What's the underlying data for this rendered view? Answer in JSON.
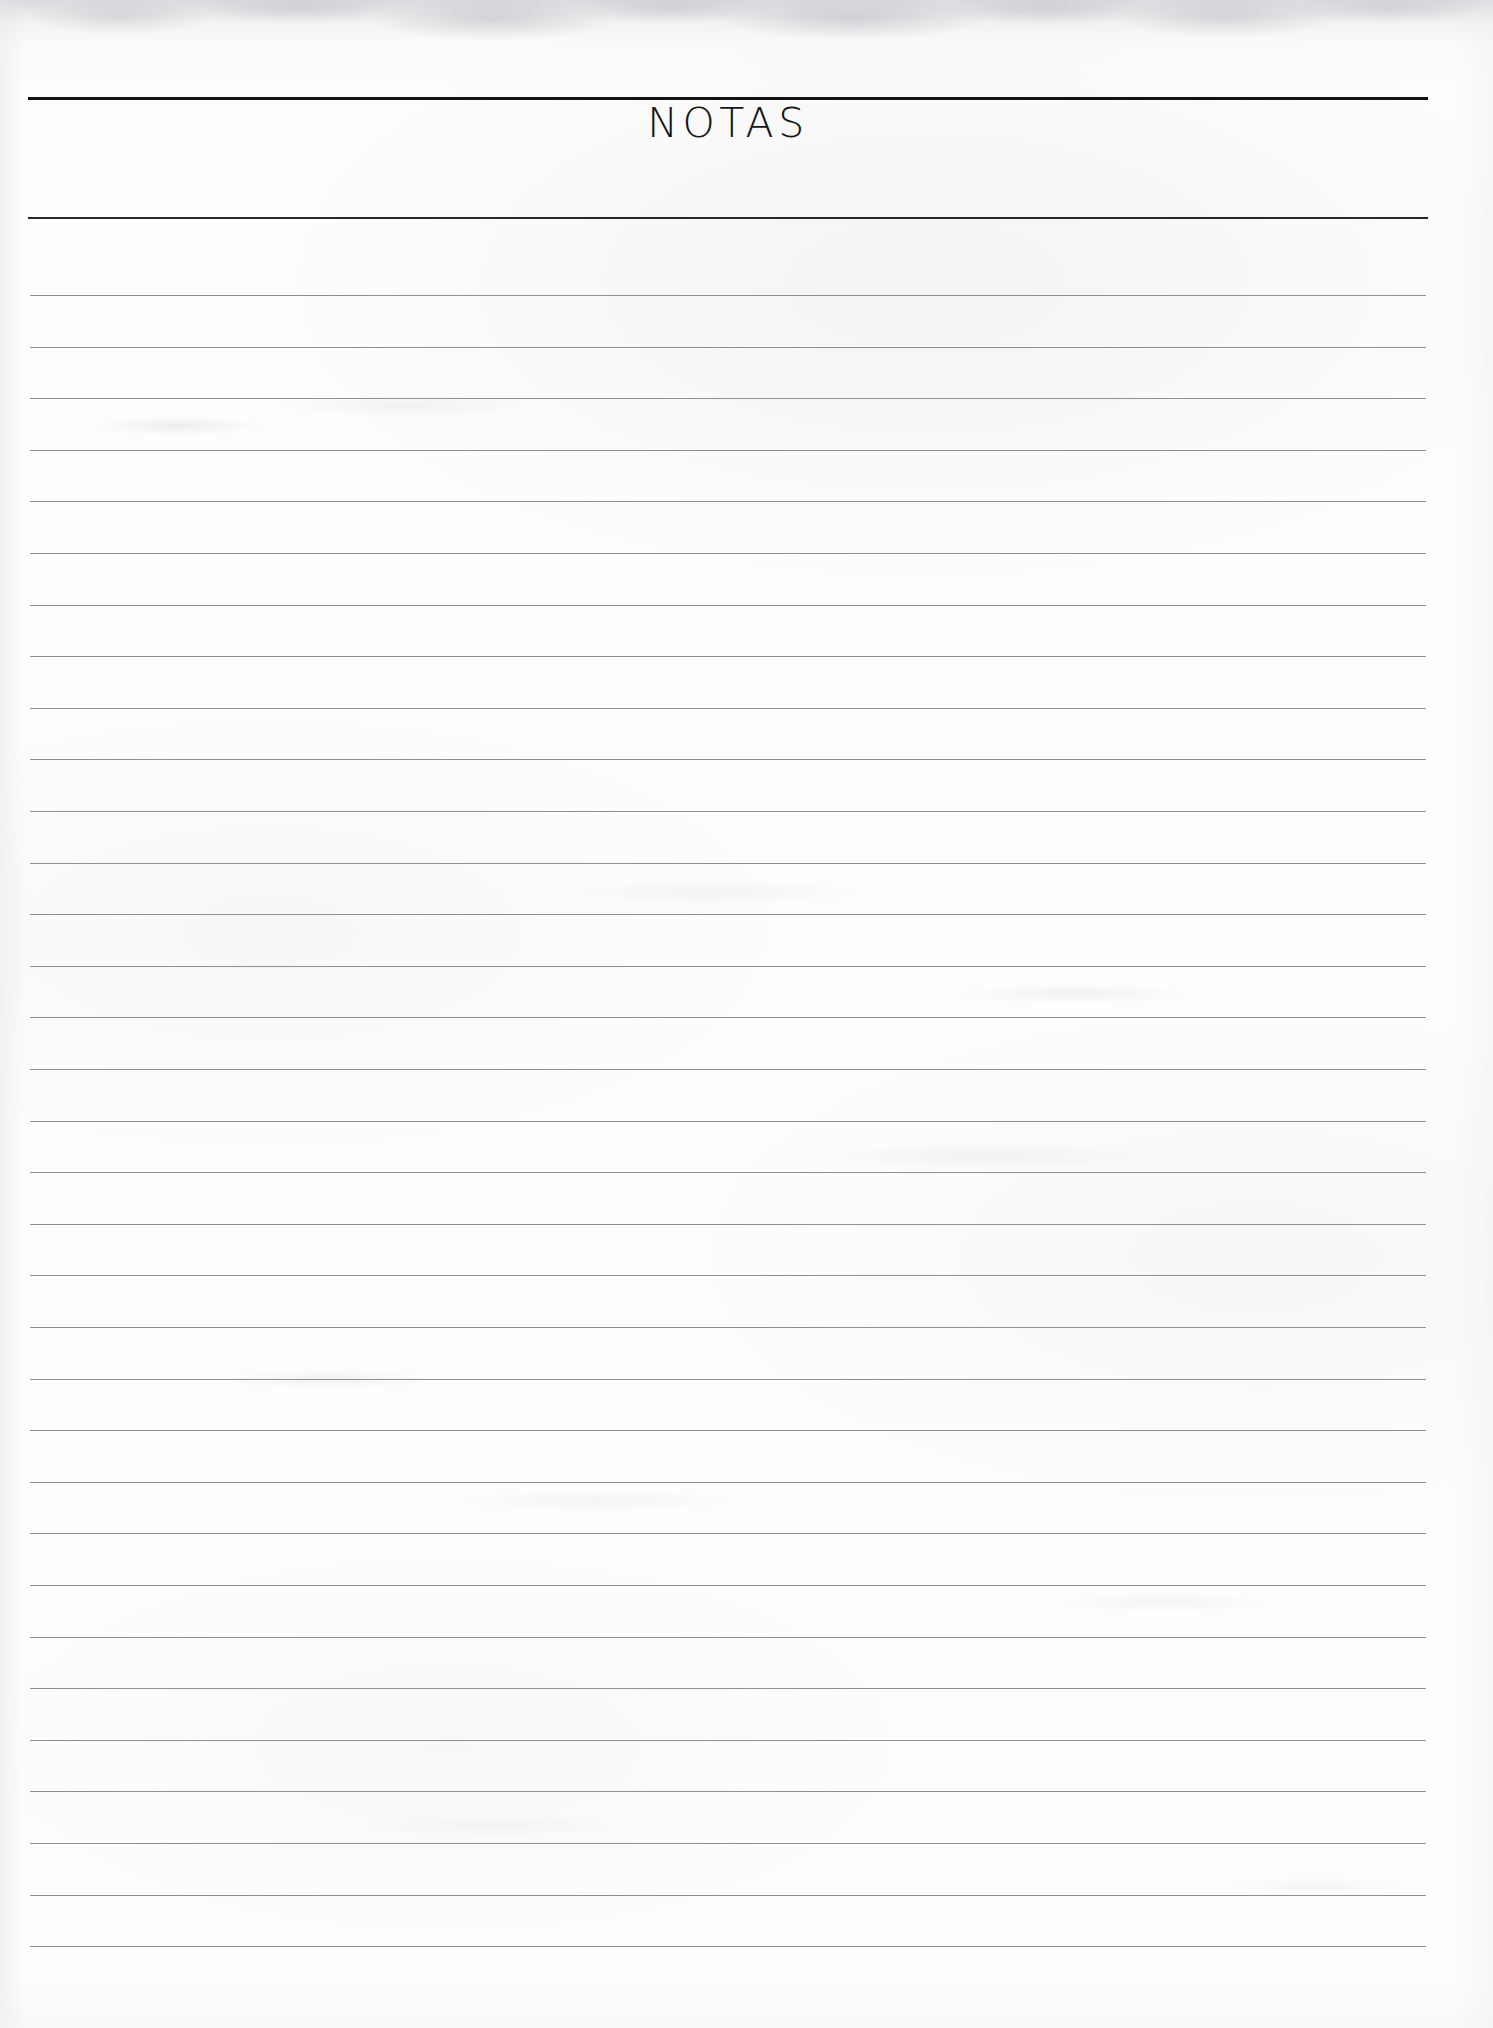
{
  "page": {
    "title": "NOTAS",
    "paper_color": "#fdfdfc",
    "header_rule_color": "#111214",
    "header_rule_secondary_color": "#26282b",
    "rule_line_color": "#8f9093",
    "title_color": "#141518"
  },
  "header": {
    "title": "NOTAS",
    "rule_top": {
      "name": "header-top-rule",
      "x": 28,
      "y": 97,
      "width": 1400,
      "thickness": 3
    },
    "rule_bottom": {
      "name": "header-bottom-rule",
      "x": 28,
      "y": 217,
      "width": 1400,
      "thickness": 2
    }
  },
  "notes_area": {
    "line_count": 33,
    "first_line_y": 295,
    "line_spacing": 51.6,
    "line_left": 30,
    "line_width": 1396,
    "line_thickness": 1,
    "lines_y": [
      295,
      346.6,
      398.2,
      449.8,
      501.4,
      553,
      604.6,
      656.2,
      707.8,
      759.4,
      811,
      862.6,
      914.2,
      965.8,
      1017.4,
      1069,
      1120.6,
      1172.2,
      1223.8,
      1275.4,
      1327,
      1378.6,
      1430.2,
      1481.8,
      1533.4,
      1585,
      1636.6,
      1688.2,
      1739.8,
      1791.4,
      1843,
      1894.6,
      1946.2
    ]
  }
}
